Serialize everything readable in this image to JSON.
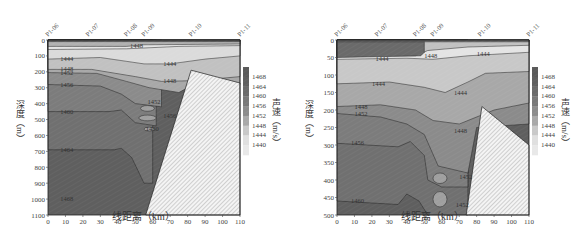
{
  "chart_data": [
    {
      "type": "heatmap",
      "subtype": "contour-section",
      "title": "",
      "xlabel": "线距离（km）",
      "ylabel": "深度（m）",
      "colorbar_label": "声速（m/s）",
      "xlim": [
        0,
        110
      ],
      "ylim": [
        1100,
        0
      ],
      "x_ticks": [
        0,
        10,
        20,
        30,
        40,
        50,
        60,
        70,
        80,
        90,
        100,
        110
      ],
      "y_ticks": [
        0,
        100,
        200,
        300,
        400,
        500,
        600,
        700,
        800,
        900,
        1000,
        1100
      ],
      "stations": [
        {
          "name": "P1-06",
          "x": 0
        },
        {
          "name": "P1-07",
          "x": 23
        },
        {
          "name": "P1-08",
          "x": 45
        },
        {
          "name": "P1-09",
          "x": 55
        },
        {
          "name": "P1-10",
          "x": 82
        },
        {
          "name": "P1-11",
          "x": 110
        }
      ],
      "colorbar_ticks": [
        1440,
        1444,
        1448,
        1452,
        1456,
        1460,
        1464,
        1468
      ],
      "contour_labels": [
        {
          "value": 1448,
          "x": 47,
          "y": 35
        },
        {
          "value": 1444,
          "x": 7,
          "y": 120
        },
        {
          "value": 1444,
          "x": 66,
          "y": 150
        },
        {
          "value": 1448,
          "x": 7,
          "y": 185
        },
        {
          "value": 1452,
          "x": 7,
          "y": 205
        },
        {
          "value": 1448,
          "x": 66,
          "y": 255
        },
        {
          "value": 1456,
          "x": 7,
          "y": 280
        },
        {
          "value": 1452,
          "x": 57,
          "y": 390
        },
        {
          "value": 1460,
          "x": 7,
          "y": 450
        },
        {
          "value": 1456,
          "x": 66,
          "y": 480
        },
        {
          "value": 1460,
          "x": 56,
          "y": 560
        },
        {
          "value": 1464,
          "x": 7,
          "y": 690
        },
        {
          "value": 1468,
          "x": 7,
          "y": 1000
        }
      ],
      "grid": false,
      "seafloor_polygon_km_m": [
        [
          56,
          1100
        ],
        [
          82,
          190
        ],
        [
          110,
          270
        ],
        [
          110,
          1100
        ]
      ]
    },
    {
      "type": "heatmap",
      "subtype": "contour-section",
      "title": "",
      "xlabel": "线距离（km）",
      "ylabel": "深度（m）",
      "colorbar_label": "声速（m/s）",
      "xlim": [
        0,
        110
      ],
      "ylim": [
        500,
        0
      ],
      "x_ticks": [
        0,
        10,
        20,
        30,
        40,
        50,
        60,
        70,
        80,
        90,
        100,
        110
      ],
      "y_ticks": [
        0,
        50,
        100,
        150,
        200,
        250,
        300,
        350,
        400,
        450,
        500
      ],
      "stations": [
        {
          "name": "P1-06",
          "x": 0
        },
        {
          "name": "P1-07",
          "x": 23
        },
        {
          "name": "P1-08",
          "x": 45
        },
        {
          "name": "P1-09",
          "x": 55
        },
        {
          "name": "P1-10",
          "x": 82
        },
        {
          "name": "P1-11",
          "x": 110
        }
      ],
      "colorbar_ticks": [
        1440,
        1444,
        1448,
        1452,
        1456,
        1460,
        1464,
        1468
      ],
      "contour_labels": [
        {
          "value": 1444,
          "x": 22,
          "y": 55
        },
        {
          "value": 1448,
          "x": 50,
          "y": 45
        },
        {
          "value": 1444,
          "x": 80,
          "y": 40
        },
        {
          "value": 1444,
          "x": 20,
          "y": 125
        },
        {
          "value": 1444,
          "x": 67,
          "y": 150
        },
        {
          "value": 1448,
          "x": 10,
          "y": 190
        },
        {
          "value": 1452,
          "x": 10,
          "y": 210
        },
        {
          "value": 1448,
          "x": 67,
          "y": 260
        },
        {
          "value": 1456,
          "x": 8,
          "y": 295
        },
        {
          "value": 1452,
          "x": 70,
          "y": 390
        },
        {
          "value": 1460,
          "x": 8,
          "y": 460
        },
        {
          "value": 1452,
          "x": 68,
          "y": 470
        }
      ],
      "grid": false,
      "seafloor_polygon_km_m": [
        [
          74,
          500
        ],
        [
          83,
          190
        ],
        [
          110,
          300
        ],
        [
          110,
          500
        ]
      ]
    }
  ],
  "left": {
    "xlabel": "线距离（km）",
    "ylabel": "深度（m）",
    "cblabel": "声速（m/s）"
  },
  "right": {
    "xlabel": "线距离（km）",
    "ylabel": "深度（m）",
    "cblabel": "声速（m/s）"
  }
}
